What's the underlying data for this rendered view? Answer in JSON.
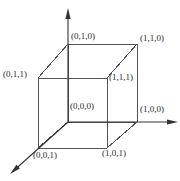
{
  "figure": {
    "width": 180,
    "height": 181,
    "background_color": "#ffffff",
    "line_color": "#555555",
    "axis_color": "#333333",
    "text_color": "#2b2b2b",
    "line_width": 1
  },
  "axes": [
    {
      "name": "y-axis",
      "direction": "up",
      "from": [
        68,
        122
      ],
      "to": [
        68,
        8
      ],
      "arrow": true
    },
    {
      "name": "x-axis",
      "direction": "right",
      "from": [
        68,
        122
      ],
      "to": [
        178,
        122
      ],
      "arrow": true
    },
    {
      "name": "z-axis",
      "direction": "down-left",
      "from": [
        68,
        122
      ],
      "to": [
        10,
        174
      ],
      "arrow": true
    }
  ],
  "vertices": [
    {
      "id": "v-010",
      "label": "(0,1,0)",
      "point": [
        68,
        44
      ],
      "label_x": 71,
      "label_y": 31
    },
    {
      "id": "v-110",
      "label": "(1,1,0)",
      "point": [
        137,
        44
      ],
      "label_x": 140,
      "label_y": 33
    },
    {
      "id": "v-011",
      "label": "(0,1,1)",
      "point": [
        38,
        78
      ],
      "label_x": 3,
      "label_y": 69
    },
    {
      "id": "v-111",
      "label": "(1,1,1)",
      "point": [
        107,
        78
      ],
      "label_x": 109,
      "label_y": 72
    },
    {
      "id": "v-000",
      "label": "(0,0,0)",
      "point": [
        68,
        122
      ],
      "label_x": 70,
      "label_y": 101
    },
    {
      "id": "v-100",
      "label": "(1,0,0)",
      "point": [
        137,
        122
      ],
      "label_x": 140,
      "label_y": 104
    },
    {
      "id": "v-001",
      "label": "(0,0,1)",
      "point": [
        38,
        148
      ],
      "label_x": 33,
      "label_y": 150
    },
    {
      "id": "v-101",
      "label": "(1,0,1)",
      "point": [
        107,
        148
      ],
      "label_x": 102,
      "label_y": 148
    }
  ],
  "edges": [
    {
      "name": "edge-back-top",
      "from": [
        68,
        44
      ],
      "to": [
        137,
        44
      ]
    },
    {
      "name": "edge-back-left",
      "from": [
        68,
        44
      ],
      "to": [
        68,
        122
      ]
    },
    {
      "name": "edge-back-right",
      "from": [
        137,
        44
      ],
      "to": [
        137,
        122
      ]
    },
    {
      "name": "edge-back-bottom",
      "from": [
        68,
        122
      ],
      "to": [
        137,
        122
      ]
    },
    {
      "name": "edge-front-top",
      "from": [
        38,
        78
      ],
      "to": [
        107,
        78
      ]
    },
    {
      "name": "edge-front-left",
      "from": [
        38,
        78
      ],
      "to": [
        38,
        148
      ]
    },
    {
      "name": "edge-front-right",
      "from": [
        107,
        78
      ],
      "to": [
        107,
        148
      ]
    },
    {
      "name": "edge-front-bottom",
      "from": [
        38,
        148
      ],
      "to": [
        107,
        148
      ]
    },
    {
      "name": "edge-depth-top-left",
      "from": [
        38,
        78
      ],
      "to": [
        68,
        44
      ]
    },
    {
      "name": "edge-depth-top-right",
      "from": [
        107,
        78
      ],
      "to": [
        137,
        44
      ]
    },
    {
      "name": "edge-depth-bottom-left",
      "from": [
        38,
        148
      ],
      "to": [
        68,
        122
      ]
    },
    {
      "name": "edge-depth-bottom-right",
      "from": [
        107,
        148
      ],
      "to": [
        137,
        122
      ]
    }
  ]
}
